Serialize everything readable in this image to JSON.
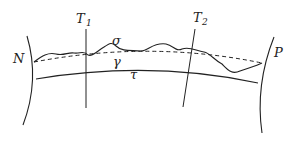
{
  "diagram": {
    "labels": {
      "N": "N",
      "P": "P",
      "T1": "T",
      "T1_sub": "1",
      "T2": "T",
      "T2_sub": "2",
      "sigma": "σ",
      "gamma": "γ",
      "tau": "τ"
    },
    "colors": {
      "stroke": "#222222",
      "background": "#ffffff"
    }
  }
}
